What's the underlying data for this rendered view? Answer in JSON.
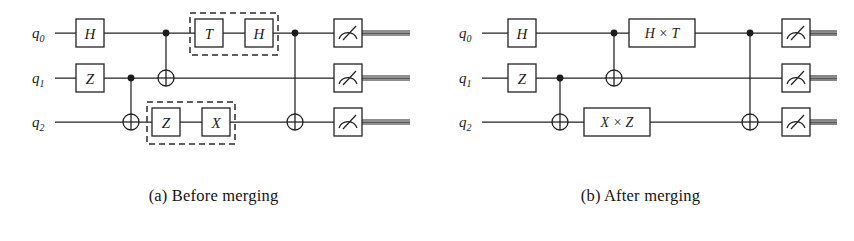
{
  "figure": {
    "panels": [
      {
        "id": "a",
        "caption": "(a) Before merging",
        "qubit_labels": [
          {
            "base": "q",
            "sub": "0"
          },
          {
            "base": "q",
            "sub": "1"
          },
          {
            "base": "q",
            "sub": "2"
          }
        ],
        "gates": [
          {
            "name": "hadamard-gate",
            "label": "H",
            "wire": 0,
            "x": 90
          },
          {
            "name": "pauli-z-gate",
            "label": "Z",
            "wire": 1,
            "x": 90
          },
          {
            "name": "t-gate",
            "label": "T",
            "wire": 0,
            "x": 209
          },
          {
            "name": "hadamard-gate-2",
            "label": "H",
            "wire": 0,
            "x": 259
          },
          {
            "name": "pauli-z-gate-2",
            "label": "Z",
            "wire": 2,
            "x": 166
          },
          {
            "name": "pauli-x-gate",
            "label": "X",
            "wire": 2,
            "x": 216
          }
        ],
        "cnots": [
          {
            "name": "cnot-q1-q2",
            "control": 1,
            "target": 2,
            "x": 131
          },
          {
            "name": "cnot-q0-q1",
            "control": 0,
            "target": 1,
            "x": 166
          },
          {
            "name": "cnot-q0-q2",
            "control": 0,
            "target": 2,
            "x": 295
          }
        ],
        "dashed_groups": [
          {
            "name": "merge-group-q0",
            "x": 190,
            "y": 13,
            "w": 88,
            "h": 42
          },
          {
            "name": "merge-group-q2",
            "x": 147,
            "y": 102,
            "w": 88,
            "h": 42
          }
        ],
        "measurements": [
          {
            "name": "measure-q0",
            "wire": 0,
            "x": 348
          },
          {
            "name": "measure-q1",
            "wire": 1,
            "x": 348
          },
          {
            "name": "measure-q2",
            "wire": 2,
            "x": 348
          }
        ]
      },
      {
        "id": "b",
        "caption": "(b) After merging",
        "qubit_labels": [
          {
            "base": "q",
            "sub": "0"
          },
          {
            "base": "q",
            "sub": "1"
          },
          {
            "base": "q",
            "sub": "2"
          }
        ],
        "gates": [
          {
            "name": "hadamard-gate",
            "label": "H",
            "wire": 0,
            "x": 95
          },
          {
            "name": "pauli-z-gate",
            "label": "Z",
            "wire": 1,
            "x": 95
          },
          {
            "name": "merged-gate-h-times-t",
            "label": "H × T",
            "wire": 0,
            "x": 235,
            "w": 66
          },
          {
            "name": "merged-gate-x-times-z",
            "label": "X × Z",
            "wire": 2,
            "x": 190,
            "w": 66
          }
        ],
        "cnots": [
          {
            "name": "cnot-q1-q2",
            "control": 1,
            "target": 2,
            "x": 133
          },
          {
            "name": "cnot-q0-q1",
            "control": 0,
            "target": 1,
            "x": 187
          },
          {
            "name": "cnot-q0-q2",
            "control": 0,
            "target": 2,
            "x": 323
          }
        ],
        "dashed_groups": [],
        "measurements": [
          {
            "name": "measure-q0",
            "wire": 0,
            "x": 369
          },
          {
            "name": "measure-q1",
            "wire": 1,
            "x": 369
          },
          {
            "name": "measure-q2",
            "wire": 2,
            "x": 369
          }
        ]
      }
    ],
    "geometry": {
      "wire_y": [
        33,
        78,
        122
      ],
      "wire_start_x": 55,
      "wire_end_x": 410,
      "gate_size": 28,
      "label_x": 32
    },
    "colors": {
      "ink": "#1b1b1b",
      "line": "#222222",
      "background": "#ffffff"
    }
  }
}
